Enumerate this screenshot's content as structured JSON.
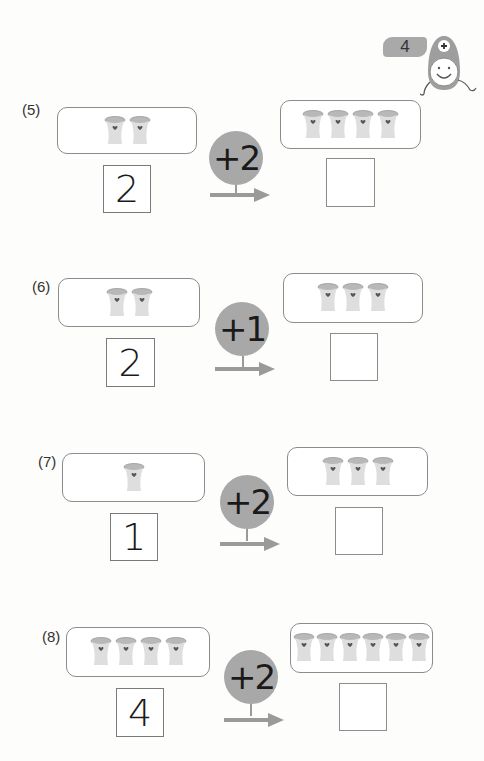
{
  "header": {
    "page_number": "4",
    "mascot_icon": "plus-mascot-icon"
  },
  "problems": [
    {
      "label": "(5)",
      "start_count": 2,
      "start_value": "2",
      "operation": "+2",
      "end_count": 4,
      "answer": ""
    },
    {
      "label": "(6)",
      "start_count": 2,
      "start_value": "2",
      "operation": "+1",
      "end_count": 3,
      "answer": ""
    },
    {
      "label": "(7)",
      "start_count": 1,
      "start_value": "1",
      "operation": "+2",
      "end_count": 3,
      "answer": ""
    },
    {
      "label": "(8)",
      "start_count": 4,
      "start_value": "4",
      "operation": "+2",
      "end_count": 6,
      "answer": ""
    }
  ],
  "icons": {
    "cup": "cup-with-heart-icon",
    "arrow": "right-arrow-icon"
  },
  "colors": {
    "badge": "#a9a9a9",
    "operator_circle": "#a8a8a8",
    "arrow": "#9a9a9a",
    "box_border": "#8c8c8c",
    "cup_body": "#dcdcdc",
    "cup_rim": "#b5b5b5",
    "heart": "#555555"
  }
}
